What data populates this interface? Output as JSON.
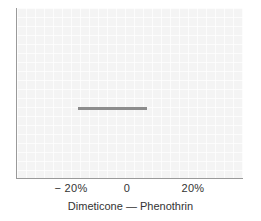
{
  "chart_data": {
    "type": "line",
    "title": "",
    "subtitle": "",
    "xlabel": "Dimeticone — Phenothrin",
    "ylabel": "",
    "xlim": [
      -28.5,
      37.5
    ],
    "ylim": [
      0,
      1
    ],
    "grid": true,
    "legend": null,
    "xticks": [
      {
        "value": -20,
        "label": "− 20%",
        "px": 71
      },
      {
        "value": 0,
        "label": "0",
        "px": 127
      },
      {
        "value": 20,
        "label": "20%",
        "px": 193
      }
    ],
    "yticks": [],
    "series": [
      {
        "name": "Dimeticone — Phenothrin",
        "type": "confidence-interval",
        "orientation": "horizontal",
        "y_position": 0.58,
        "low": -17.7,
        "high": 4.9,
        "color": "#8c8c8c"
      }
    ],
    "annotations": []
  },
  "figure": {
    "panel_background": "#f4f4f4",
    "axis_color": "#9a9a9a",
    "text_color": "#333333",
    "interval_color": "#8c8c8c"
  },
  "axis": {
    "title": "Dimeticone — Phenothrin",
    "tick_left": "− 20%",
    "tick_center": "0",
    "tick_right": "20%"
  }
}
